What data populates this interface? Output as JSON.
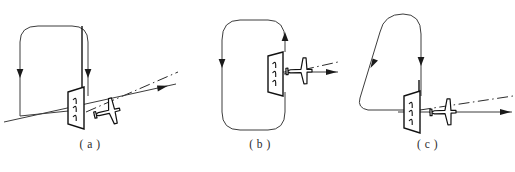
{
  "figure": {
    "background_color": "#ffffff",
    "line_color": "#3d3d3d",
    "ink_color": "#111111"
  },
  "panels": [
    {
      "id": "a",
      "caption": "( a )",
      "track_shape": "rounded-rectangle",
      "track_arrows": [
        "down-left-leg",
        "down-right-leg"
      ],
      "approach_line": "solid-with-arrowhead",
      "centerline": "dash-dot",
      "marker": "runway-marker-panel",
      "aircraft": "aircraft-plan-view"
    },
    {
      "id": "b",
      "caption": "( b )",
      "track_shape": "rounded-rectangle",
      "track_arrows": [
        "down-left-leg",
        "up-right-leg"
      ],
      "approach_line": "solid-with-arrowhead",
      "centerline": "dash-dot",
      "marker": "runway-marker-panel",
      "aircraft": "aircraft-plan-view"
    },
    {
      "id": "c",
      "caption": "( c )",
      "track_shape": "teardrop",
      "track_arrows": [
        "down-slanted-leg",
        "down-right-leg"
      ],
      "approach_line": "solid-with-arrowhead",
      "centerline": "dash-dot",
      "marker": "runway-marker-panel",
      "aircraft": "aircraft-plan-view"
    }
  ]
}
